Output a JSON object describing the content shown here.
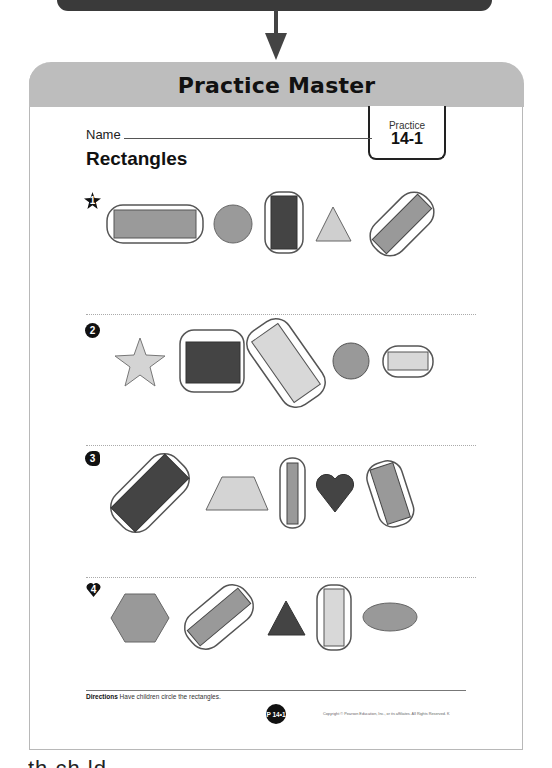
{
  "top_connector": {
    "bar_color": "#3a3a3a",
    "arrow_color": "#444444"
  },
  "header": {
    "title": "Practice Master",
    "band_color": "#bdbdbd"
  },
  "worksheet": {
    "name_label": "Name",
    "title": "Rectangles",
    "practice_tab": {
      "label": "Practice",
      "number": "14-1"
    },
    "items": [
      {
        "number": "1",
        "badge_icon": "star-badge-icon",
        "shapes": [
          "rectangle (circled)",
          "circle",
          "rectangle (circled)",
          "triangle",
          "rectangle (circled)"
        ]
      },
      {
        "number": "2",
        "badge_icon": "apple-badge-icon",
        "shapes": [
          "star",
          "rectangle (circled)",
          "rectangle (circled)",
          "circle",
          "rectangle (circled)"
        ]
      },
      {
        "number": "3",
        "badge_icon": "fish-badge-icon",
        "shapes": [
          "rectangle (circled)",
          "trapezoid",
          "rectangle (circled)",
          "heart",
          "rectangle (circled)"
        ]
      },
      {
        "number": "4",
        "badge_icon": "heart-badge-icon",
        "shapes": [
          "hexagon",
          "rectangle (circled)",
          "triangle",
          "rectangle (circled)",
          "ellipse"
        ]
      }
    ],
    "directions_label": "Directions",
    "directions_text": "Have children circle the rectangles.",
    "page_badge": "P 14•1",
    "copyright": "Copyright © Pearson Education, Inc., or its affiliates. All Rights Reserved. K"
  },
  "caption_fragment": "th     ch ld  "
}
